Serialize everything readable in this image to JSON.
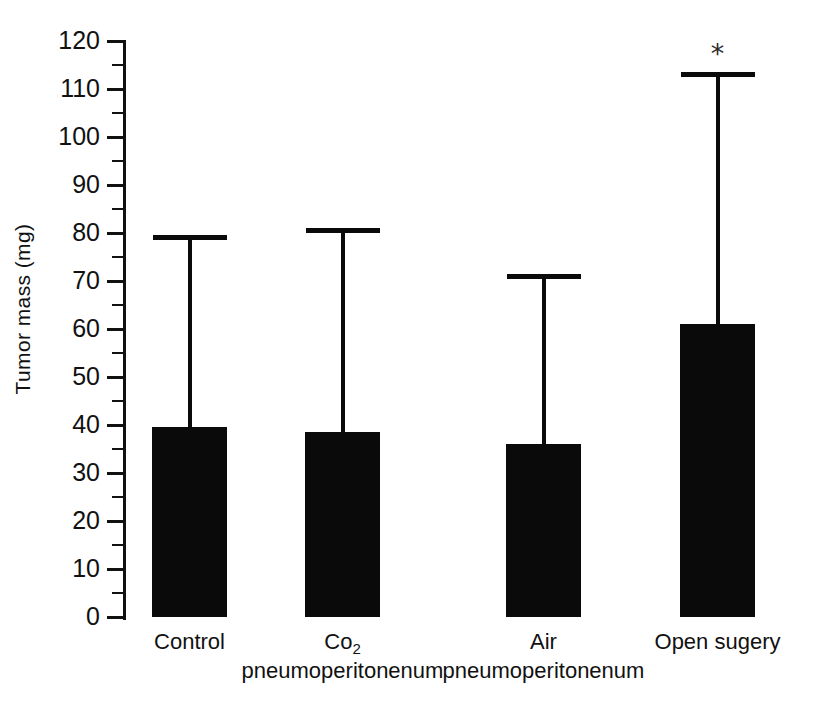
{
  "chart_data": {
    "type": "bar",
    "title": "",
    "subtitle": "",
    "xlabel": "",
    "ylabel": "Tumor mass (mg)",
    "ylim": [
      0,
      120
    ],
    "ytick_step": 10,
    "yminor_step": 5,
    "grid": false,
    "legend": null,
    "bar_color": "#0a0a0a",
    "axis_color": "#111111",
    "categories": [
      "Control",
      "Co2 pneumoperitonenum",
      "Air pneumoperitonenum",
      "Open sugery"
    ],
    "values": [
      39.5,
      38.5,
      36,
      61
    ],
    "error_high": [
      79.5,
      81,
      71.5,
      113.5
    ],
    "annotations": [
      {
        "category_index": 3,
        "symbol": "*",
        "meaning": "significant"
      }
    ],
    "ytick_labels": [
      "0",
      "10",
      "20",
      "30",
      "40",
      "50",
      "60",
      "70",
      "80",
      "90",
      "100",
      "110",
      "120"
    ]
  },
  "axis": {
    "y_label": "Tumor mass (mg)",
    "ticks": [
      {
        "value": 120,
        "label": "120"
      },
      {
        "value": 110,
        "label": "110"
      },
      {
        "value": 100,
        "label": "100"
      },
      {
        "value": 90,
        "label": "90"
      },
      {
        "value": 80,
        "label": "80"
      },
      {
        "value": 70,
        "label": "70"
      },
      {
        "value": 60,
        "label": "60"
      },
      {
        "value": 50,
        "label": "50"
      },
      {
        "value": 40,
        "label": "40"
      },
      {
        "value": 30,
        "label": "30"
      },
      {
        "value": 20,
        "label": "20"
      },
      {
        "value": 10,
        "label": "10"
      },
      {
        "value": 0,
        "label": "0"
      }
    ]
  },
  "bars": [
    {
      "label_line1": "Control",
      "label_line2": "",
      "has_subscript": false,
      "subscript": "",
      "value": 39.5,
      "error_top": 79.5,
      "star": ""
    },
    {
      "label_line1": "Co",
      "label_line2": "pneumoperitonenum",
      "has_subscript": true,
      "subscript": "2",
      "value": 38.5,
      "error_top": 81,
      "star": ""
    },
    {
      "label_line1": "Air",
      "label_line2": "pneumoperitonenum",
      "has_subscript": false,
      "subscript": "",
      "value": 36,
      "error_top": 71.5,
      "star": ""
    },
    {
      "label_line1": "Open sugery",
      "label_line2": "",
      "has_subscript": false,
      "subscript": "",
      "value": 61,
      "error_top": 113.5,
      "star": "*"
    }
  ]
}
